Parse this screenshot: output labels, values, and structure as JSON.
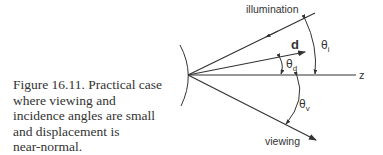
{
  "caption": {
    "line1": "Figure 16.11.  Practical case",
    "line2": "where viewing and",
    "line3": "incidence angles are small",
    "line4": "and displacement is",
    "line5": "near-normal."
  },
  "diagram": {
    "labels": {
      "illumination": "illumination",
      "d": "d",
      "theta_i": "θ",
      "theta_i_sub": "i",
      "theta_d": "θ",
      "theta_d_sub": "d",
      "z": "z",
      "theta_v": "θ",
      "theta_v_sub": "v",
      "viewing": "viewing"
    },
    "color": "#333333"
  }
}
